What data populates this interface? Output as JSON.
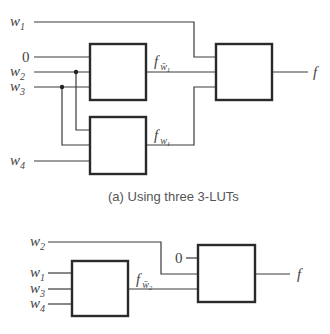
{
  "figure_a": {
    "caption": "(a) Using three 3-LUTs",
    "inputs": {
      "w1": {
        "base": "w",
        "sub": "1"
      },
      "zero": "0",
      "w2": {
        "base": "w",
        "sub": "2"
      },
      "w3": {
        "base": "w",
        "sub": "3"
      },
      "w4": {
        "base": "w",
        "sub": "4"
      }
    },
    "signals": {
      "f_wbar1": {
        "base": "f",
        "sub": "w̄",
        "subsub": "1"
      },
      "f_w1": {
        "base": "f",
        "sub": "w",
        "subsub": "1"
      }
    },
    "output": "f",
    "luts": [
      "LUT 1",
      "LUT 2",
      "LUT 3"
    ]
  },
  "figure_b": {
    "inputs": {
      "w2": {
        "base": "w",
        "sub": "2"
      },
      "w1": {
        "base": "w",
        "sub": "1"
      },
      "w3": {
        "base": "w",
        "sub": "3"
      },
      "w4": {
        "base": "w",
        "sub": "4"
      },
      "zero": "0"
    },
    "signals": {
      "f_wbar2": {
        "base": "f",
        "sub": "w̄",
        "subsub": "2"
      }
    },
    "output": "f",
    "luts": [
      "LUT A",
      "LUT B"
    ]
  },
  "colors": {
    "wire": "#3a3a3a",
    "box": "#2a2a2a",
    "text": "#444444",
    "caption": "#555555"
  }
}
